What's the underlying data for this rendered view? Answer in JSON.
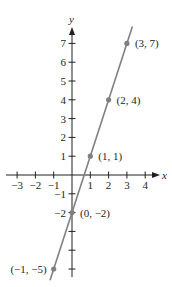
{
  "chart_data": {
    "type": "scatter",
    "title": "",
    "xlabel": "x",
    "ylabel": "y",
    "xlim": [
      -3,
      4
    ],
    "ylim": [
      -5,
      7
    ],
    "grid": false,
    "x_ticks": [
      -3,
      -2,
      -1,
      1,
      2,
      3,
      4
    ],
    "y_ticks": [
      -5,
      -4,
      -3,
      -2,
      -1,
      1,
      2,
      3,
      4,
      5,
      6,
      7
    ],
    "x_tick_labels": [
      "−3",
      "−2",
      "−1",
      "1",
      "2",
      "3",
      "4"
    ],
    "y_tick_labels_shown": {
      "7": "7",
      "6": "6",
      "5": "5",
      "4": "4",
      "3": "3",
      "2": "2",
      "1": "1",
      "-1": "−1",
      "-2": "−2"
    },
    "series": [
      {
        "name": "y = 3x − 2",
        "x": [
          -1,
          0,
          1,
          2,
          3
        ],
        "y": [
          -5,
          -2,
          1,
          4,
          7
        ],
        "labels": [
          "(−1, −5)",
          "(0, −2)",
          "(1, 1)",
          "(2, 4)",
          "(3, 7)"
        ],
        "line_extent_x": [
          -1.2,
          3.3
        ]
      }
    ],
    "colors": {
      "axes": "#231f20",
      "line": "#808080",
      "points": "#808080"
    }
  }
}
